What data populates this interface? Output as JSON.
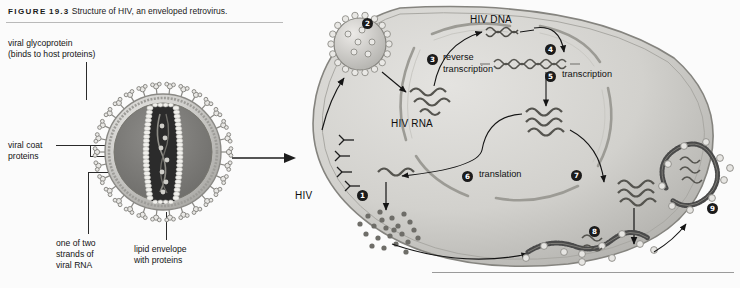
{
  "figure": {
    "label_word": "FIGURE",
    "number": "19.3",
    "caption": "Structure of HIV, an enveloped retrovirus."
  },
  "colors": {
    "background": "#fbfbfb",
    "ink": "#1a1a1a",
    "rule": "#b9b9b9",
    "badge_fill": "#1b1b1b",
    "badge_text": "#ffffff",
    "cell_fill": "#d7d7d4",
    "cell_edge": "#8d8d88",
    "nucleus_edge": "#9b9b96",
    "virion_body": "#c9c9c6",
    "spike_fill": "#e6e6e4",
    "capsid_bead": "#f0efeb",
    "core_dark": "#2e2e2e",
    "membrane_dark": "#4a4a4a"
  },
  "left_panel": {
    "name": "hiv-virion-cutaway",
    "labels": [
      {
        "id": "viral-glycoprotein",
        "text": "viral glycoprotein\n(binds to host proteins)"
      },
      {
        "id": "viral-coat-proteins",
        "text": "viral coat\nproteins"
      },
      {
        "id": "viral-rna",
        "text": "one of two\nstrands of\nviral RNA"
      },
      {
        "id": "lipid-envelope",
        "text": "lipid envelope\nwith proteins"
      }
    ]
  },
  "right_panel": {
    "name": "hiv-replication-cycle",
    "virus_label": "HIV",
    "molecule_labels": [
      {
        "id": "hiv-rna",
        "text": "HIV RNA"
      },
      {
        "id": "hiv-dna",
        "text": "HIV DNA"
      }
    ],
    "steps": [
      {
        "number": "1",
        "glyph": "❶",
        "label": ""
      },
      {
        "number": "2",
        "glyph": "❷",
        "label": ""
      },
      {
        "number": "3",
        "glyph": "❸",
        "label": "reverse\ntranscription"
      },
      {
        "number": "4",
        "glyph": "❹",
        "label": ""
      },
      {
        "number": "5",
        "glyph": "❺",
        "label": "transcription"
      },
      {
        "number": "6",
        "glyph": "❻",
        "label": "translation"
      },
      {
        "number": "7",
        "glyph": "❼",
        "label": ""
      },
      {
        "number": "8",
        "glyph": "❽",
        "label": ""
      },
      {
        "number": "9",
        "glyph": "❾",
        "label": ""
      }
    ]
  }
}
